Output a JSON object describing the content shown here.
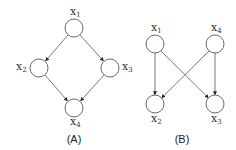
{
  "diagrams": [
    {
      "caption": "(A)",
      "nodes": [
        {
          "id": "x1",
          "base": "x",
          "sub": "1"
        },
        {
          "id": "x2",
          "base": "x",
          "sub": "2"
        },
        {
          "id": "x3",
          "base": "x",
          "sub": "3"
        },
        {
          "id": "x4",
          "base": "x",
          "sub": "4"
        }
      ],
      "edges": [
        {
          "from": "x1",
          "to": "x2"
        },
        {
          "from": "x1",
          "to": "x3"
        },
        {
          "from": "x2",
          "to": "x4"
        },
        {
          "from": "x3",
          "to": "x4"
        }
      ]
    },
    {
      "caption": "(B)",
      "nodes": [
        {
          "id": "x1",
          "base": "x",
          "sub": "1"
        },
        {
          "id": "x4",
          "base": "x",
          "sub": "4"
        },
        {
          "id": "x2",
          "base": "x",
          "sub": "2"
        },
        {
          "id": "x3",
          "base": "x",
          "sub": "3"
        }
      ],
      "edges": [
        {
          "from": "x1",
          "to": "x2"
        },
        {
          "from": "x1",
          "to": "x3"
        },
        {
          "from": "x4",
          "to": "x2"
        },
        {
          "from": "x4",
          "to": "x3"
        }
      ]
    }
  ],
  "colors": {
    "stroke": "#6a6a6a",
    "text": "#333333",
    "background": "#ffffff"
  }
}
